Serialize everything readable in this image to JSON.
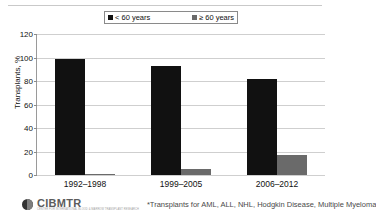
{
  "title_remnant": "Figure: Allogeneic Transplants by Recipient Age",
  "legend": {
    "entries": [
      {
        "label": "< 60 years",
        "color": "#111111",
        "icon": "square-marker-icon"
      },
      {
        "label": "≥ 60 years",
        "color": "#6a6a6a",
        "icon": "square-marker-icon"
      }
    ]
  },
  "footer": {
    "logo_wordmark": "CIBMTR",
    "logo_tagline": "CENTER FOR INTERNATIONAL BLOOD & MARROW TRANSPLANT RESEARCH",
    "footnote": "*Transplants for AML, ALL, NHL, Hodgkin Disease, Multiple Myeloma"
  },
  "chart_data": {
    "type": "bar",
    "title": "",
    "xlabel": "",
    "ylabel": "Transplants, %",
    "ylim": [
      0,
      120
    ],
    "yticks": [
      0,
      20,
      40,
      60,
      80,
      100,
      120
    ],
    "grid": true,
    "legend_position": "top",
    "categories": [
      "1992–1998",
      "1999–2005",
      "2006–2012"
    ],
    "series": [
      {
        "name": "< 60 years",
        "color": "#111111",
        "values": [
          99,
          93,
          82
        ]
      },
      {
        "name": "≥ 60 years",
        "color": "#6a6a6a",
        "values": [
          1,
          5,
          17
        ]
      }
    ]
  }
}
